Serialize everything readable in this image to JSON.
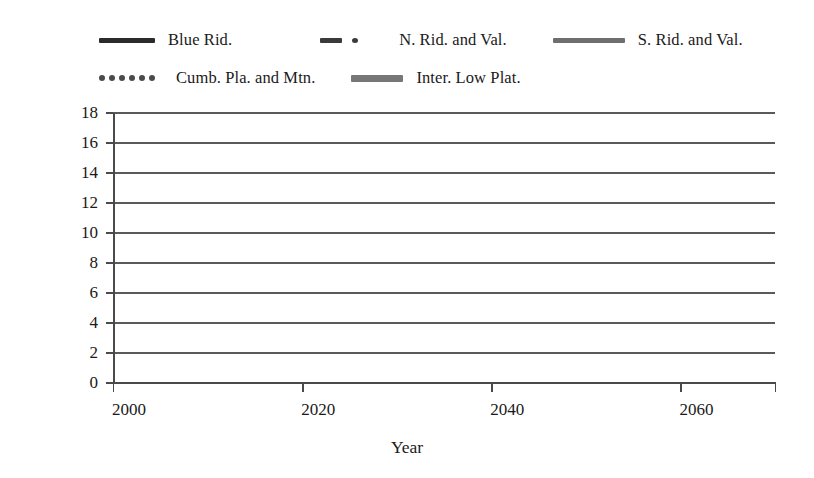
{
  "chart_data": {
    "type": "line",
    "title": "",
    "xlabel": "Year",
    "ylabel": "Mean annual temperature (°C)",
    "xlim": [
      2000,
      2070
    ],
    "ylim": [
      0,
      18
    ],
    "xticks": [
      2000,
      2020,
      2040,
      2060
    ],
    "yticks": [
      0,
      2,
      4,
      6,
      8,
      10,
      12,
      14,
      16,
      18
    ],
    "grid": "horizontal",
    "legend_position": "top",
    "x": [
      2002,
      2006,
      2010,
      2014,
      2018,
      2022,
      2026,
      2030,
      2034,
      2038,
      2042,
      2046,
      2050,
      2054,
      2058,
      2060
    ],
    "series": [
      {
        "name": "Blue Rid.",
        "style": "solid-thick-dark",
        "color": "#2b2b2b",
        "values": [
          12.3,
          12.4,
          12.6,
          12.8,
          12.9,
          13.0,
          13.2,
          13.3,
          13.5,
          13.6,
          13.8,
          13.9,
          14.1,
          14.3,
          14.4,
          14.5
        ]
      },
      {
        "name": "N. Rid. and Val.",
        "style": "dash-dot",
        "color": "#3a3a3a",
        "values": [
          12.1,
          12.2,
          12.4,
          12.6,
          12.7,
          12.9,
          13.0,
          13.2,
          13.3,
          13.5,
          13.6,
          13.8,
          13.9,
          14.1,
          14.2,
          14.3
        ]
      },
      {
        "name": "S. Rid. and Val.",
        "style": "solid-thick-gray",
        "color": "#6e6e6e",
        "values": [
          14.2,
          14.3,
          14.5,
          14.7,
          14.9,
          15.0,
          15.2,
          15.3,
          15.5,
          15.6,
          15.8,
          15.9,
          16.1,
          16.3,
          16.4,
          16.5
        ]
      },
      {
        "name": "Cumb. Pla. and Mtn.",
        "style": "dotted",
        "color": "#4a4a4a",
        "values": [
          13.3,
          13.4,
          13.5,
          13.7,
          13.8,
          14.0,
          14.1,
          14.3,
          14.4,
          14.6,
          14.7,
          14.9,
          15.0,
          15.2,
          15.3,
          15.4
        ]
      },
      {
        "name": "Inter. Low Plat.",
        "style": "solid-gray",
        "color": "#777777",
        "values": [
          13.2,
          13.3,
          13.4,
          13.6,
          13.7,
          13.9,
          14.0,
          14.2,
          14.3,
          14.5,
          14.6,
          14.8,
          14.9,
          15.1,
          15.2,
          15.2
        ]
      }
    ]
  },
  "legend": {
    "items": [
      {
        "label": "Blue Rid."
      },
      {
        "label": "N. Rid. and Val."
      },
      {
        "label": "S. Rid. and Val."
      },
      {
        "label": "Cumb. Pla. and Mtn."
      },
      {
        "label": "Inter. Low Plat."
      }
    ]
  },
  "axes": {
    "y_title": "Mean annual temperature (°C)",
    "x_title": "Year",
    "y_ticks": [
      "18",
      "16",
      "14",
      "12",
      "10",
      "8",
      "6",
      "4",
      "2",
      "0"
    ],
    "x_ticks": [
      "2000",
      "2020",
      "2040",
      "2060"
    ]
  }
}
